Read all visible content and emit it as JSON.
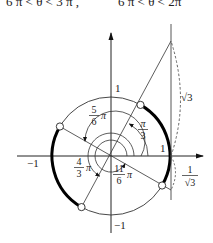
{
  "header": {
    "cutoff_text_left": "6 π < θ < 3 π ,",
    "cutoff_text_right": "6 π < θ < 2π"
  },
  "diagram": {
    "type": "unit-circle-tangent-diagram",
    "center": [
      111,
      156
    ],
    "radius": 59,
    "axes": {
      "x_label_pos_one": "1",
      "x_label_neg_one": "−1",
      "y_label_pos_one": "1",
      "y_label_neg_one": "−1"
    },
    "angles": [
      {
        "name": "pi-over-3",
        "num": "π",
        "den": "3",
        "coef": ""
      },
      {
        "name": "five-pi-over-6",
        "num": "5",
        "den": "6",
        "coef": "π"
      },
      {
        "name": "four-pi-over-3",
        "num": "4",
        "den": "3",
        "coef": "π"
      },
      {
        "name": "eleven-pi-over-6",
        "num": "11",
        "den": "6",
        "coef": "π"
      }
    ],
    "tangent_labels": {
      "sqrt3": "√3",
      "one_over_sqrt3_num": "1",
      "one_over_sqrt3_den": "√3"
    },
    "highlighted_arcs": [
      {
        "from": "-π/6",
        "to": "π/3"
      },
      {
        "from": "5π/6",
        "to": "4π/3"
      }
    ],
    "colors": {
      "stroke": "#222222",
      "thick": "#000000",
      "dashed": "#555555"
    }
  }
}
